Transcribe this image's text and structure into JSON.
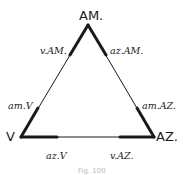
{
  "diagram": {
    "type": "triangle",
    "vertices": {
      "top": "AM.",
      "left": "V",
      "right": "AZ."
    },
    "side_labels": {
      "top_left": "v.AM.",
      "top_right": "az.AM.",
      "left_upper": "am.V",
      "right_upper": "am.AZ.",
      "bottom_left": "az.V",
      "bottom_right": "v.AZ."
    },
    "caption": "Fig. 100",
    "colors": {
      "line": "#1a1a1a",
      "background": "#ffffff"
    }
  }
}
